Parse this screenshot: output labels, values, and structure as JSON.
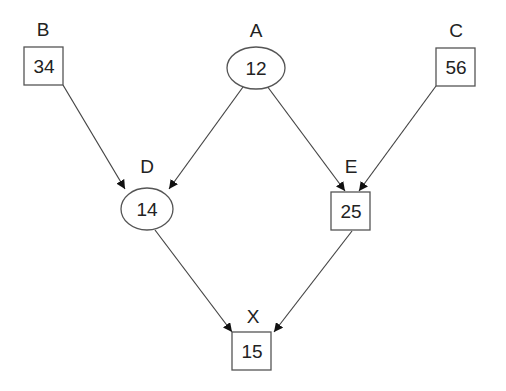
{
  "diagram": {
    "type": "directed-graph",
    "nodes": [
      {
        "id": "A",
        "label": "A",
        "value": "12",
        "shape": "ellipse"
      },
      {
        "id": "B",
        "label": "B",
        "value": "34",
        "shape": "box"
      },
      {
        "id": "C",
        "label": "C",
        "value": "56",
        "shape": "box"
      },
      {
        "id": "D",
        "label": "D",
        "value": "14",
        "shape": "ellipse"
      },
      {
        "id": "E",
        "label": "E",
        "value": "25",
        "shape": "box"
      },
      {
        "id": "X",
        "label": "X",
        "value": "15",
        "shape": "box"
      }
    ],
    "edges": [
      {
        "from": "B",
        "to": "D"
      },
      {
        "from": "A",
        "to": "D"
      },
      {
        "from": "A",
        "to": "E"
      },
      {
        "from": "C",
        "to": "E"
      },
      {
        "from": "D",
        "to": "X"
      },
      {
        "from": "E",
        "to": "X"
      }
    ]
  }
}
